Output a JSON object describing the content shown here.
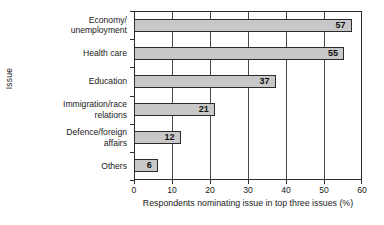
{
  "chart_data": {
    "type": "bar",
    "orientation": "horizontal",
    "title": "",
    "xlabel": "Respondents nominating issue in top three issues (%)",
    "ylabel": "Issue",
    "categories": [
      "Economy/\nunemployment",
      "Health care",
      "Education",
      "Immigration/race\nrelations",
      "Defence/foreign\naffairs",
      "Others"
    ],
    "values": [
      57,
      55,
      37,
      21,
      12,
      6
    ],
    "value_labels": [
      "57",
      "55",
      "37",
      "21",
      "12",
      "6"
    ],
    "xlim": [
      0,
      60
    ],
    "xticks": [
      0,
      10,
      20,
      30,
      40,
      50,
      60
    ],
    "xtick_labels": [
      "0",
      "10",
      "20",
      "30",
      "40",
      "50",
      "60"
    ],
    "grid": "vertical",
    "legend": "none",
    "colors": {
      "bar_fill": "#c8c8c8",
      "bar_border": "#2b2b2b",
      "axis": "#2b2b2b",
      "grid": "#4a4a4a",
      "text": "#1a1a1a",
      "background": "#ffffff"
    }
  }
}
